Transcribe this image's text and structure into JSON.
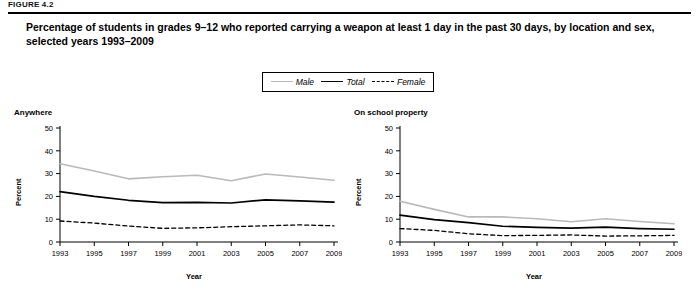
{
  "figure": {
    "label": "FIGURE 4.2",
    "title": "Percentage of students in grades 9–12 who reported carrying a weapon at least 1 day in the past 30 days, by location and sex, selected years 1993–2009"
  },
  "legend": {
    "entries": [
      {
        "label": "Male",
        "key": "male",
        "color": "#b9b9b9",
        "style": "solid"
      },
      {
        "label": "Total",
        "key": "total",
        "color": "#000000",
        "style": "solid"
      },
      {
        "label": "Female",
        "key": "female",
        "color": "#000000",
        "style": "dashed"
      }
    ]
  },
  "chart_data": [
    {
      "type": "line",
      "title": "Anywhere",
      "xlabel": "Year",
      "ylabel": "Percent",
      "x": [
        1993,
        1995,
        1997,
        1999,
        2001,
        2003,
        2005,
        2007,
        2009
      ],
      "xticklabels": [
        "1993",
        "1995",
        "1997",
        "1999",
        "2001",
        "2003",
        "2005",
        "2007",
        "2009"
      ],
      "yticklabels": [
        "0",
        "10",
        "20",
        "30",
        "40",
        "50"
      ],
      "ylim": [
        0,
        50
      ],
      "ytick_step": 10,
      "grid": false,
      "legend_position": "top-center",
      "series": [
        {
          "name": "Male",
          "values": [
            34.3,
            31.1,
            27.7,
            28.6,
            29.3,
            26.9,
            29.8,
            28.5,
            27.1
          ]
        },
        {
          "name": "Total",
          "values": [
            22.1,
            20.0,
            18.3,
            17.3,
            17.4,
            17.1,
            18.5,
            18.0,
            17.5
          ]
        },
        {
          "name": "Female",
          "values": [
            9.2,
            8.3,
            7.0,
            6.0,
            6.2,
            6.7,
            7.1,
            7.5,
            7.1
          ]
        }
      ]
    },
    {
      "type": "line",
      "title": "On school property",
      "xlabel": "Year",
      "ylabel": "Percent",
      "x": [
        1993,
        1995,
        1997,
        1999,
        2001,
        2003,
        2005,
        2007,
        2009
      ],
      "xticklabels": [
        "1993",
        "1995",
        "1997",
        "1999",
        "2001",
        "2003",
        "2005",
        "2007",
        "2009"
      ],
      "yticklabels": [
        "0",
        "10",
        "20",
        "30",
        "40",
        "50"
      ],
      "ylim": [
        0,
        50
      ],
      "ytick_step": 10,
      "grid": false,
      "legend_position": "top-center",
      "series": [
        {
          "name": "Male",
          "values": [
            17.9,
            14.3,
            11.0,
            11.0,
            10.2,
            8.9,
            10.2,
            9.0,
            8.0
          ]
        },
        {
          "name": "Total",
          "values": [
            11.8,
            9.8,
            8.5,
            6.9,
            6.4,
            6.1,
            6.5,
            5.9,
            5.6
          ]
        },
        {
          "name": "Female",
          "values": [
            5.9,
            5.1,
            3.6,
            2.8,
            2.9,
            3.1,
            2.6,
            2.7,
            2.9
          ]
        }
      ]
    }
  ]
}
